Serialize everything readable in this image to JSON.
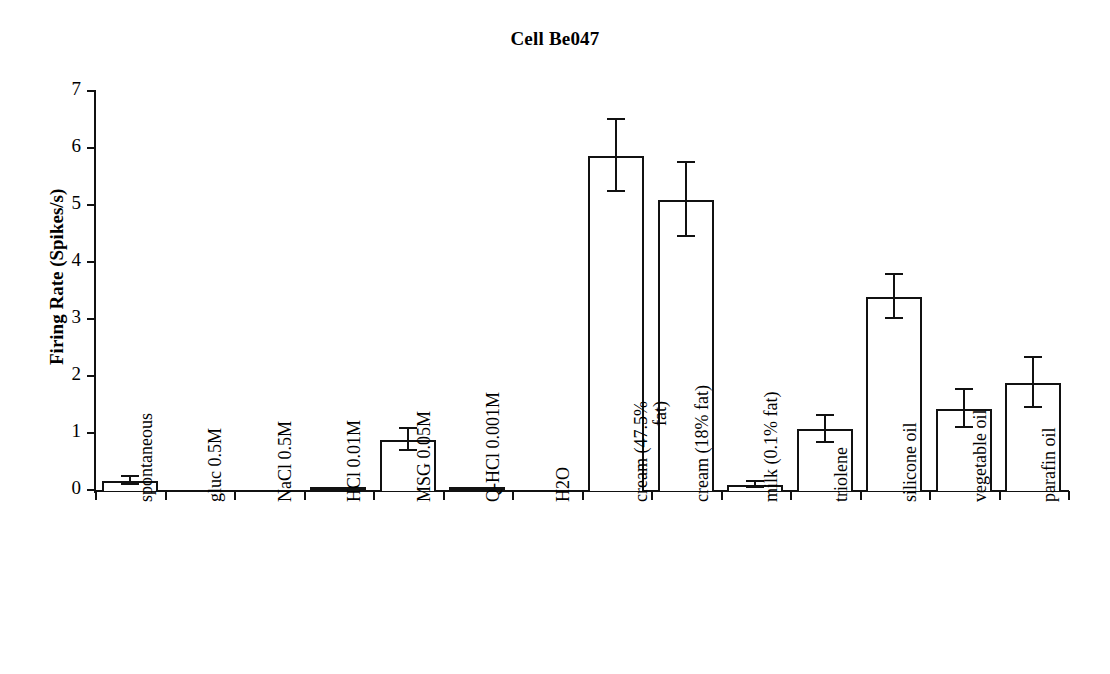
{
  "chart_data": {
    "type": "bar",
    "title": "Cell Be047",
    "xlabel": "",
    "ylabel": "Firing Rate (Spikes/s)",
    "ylim": [
      0,
      7
    ],
    "yticks": [
      0,
      1,
      2,
      3,
      4,
      5,
      6,
      7
    ],
    "grid": false,
    "legend": false,
    "categories": [
      "spontaneous",
      "gluc 0.5M",
      "NaCl 0.5M",
      "HCl 0.01M",
      "MSG 0.05M",
      "Q-HCl 0.001M",
      "H2O",
      "cream (47.5% fat)",
      "cream (18% fat)",
      "milk (0.1% fat)",
      "triolene",
      "silicone oil",
      "vegetable oil",
      "parafin oil"
    ],
    "category_lines": [
      [
        "spontaneous"
      ],
      [
        "gluc 0.5M"
      ],
      [
        "NaCl 0.5M"
      ],
      [
        "HCl 0.01M"
      ],
      [
        "MSG 0.05M"
      ],
      [
        "Q-HCl 0.001M"
      ],
      [
        "H2O"
      ],
      [
        "cream (47.5%",
        "fat)"
      ],
      [
        "cream (18% fat)"
      ],
      [
        "milk (0.1% fat)"
      ],
      [
        "triolene"
      ],
      [
        "silicone oil"
      ],
      [
        "vegetable oil"
      ],
      [
        "parafin oil"
      ]
    ],
    "values": [
      0.18,
      0.0,
      0.0,
      0.03,
      0.9,
      0.02,
      0.0,
      5.88,
      5.1,
      0.11,
      1.08,
      3.4,
      1.44,
      1.89
    ],
    "errors": [
      0.07,
      0.0,
      0.0,
      0.0,
      0.19,
      0.0,
      0.0,
      0.63,
      0.65,
      0.05,
      0.23,
      0.39,
      0.33,
      0.44
    ],
    "bar_color": "#ffffff",
    "bar_edge_color": "#111111",
    "error_color": "#111111",
    "axis_color": "#111111",
    "background": "#ffffff"
  }
}
